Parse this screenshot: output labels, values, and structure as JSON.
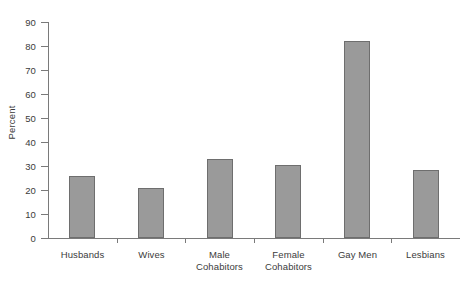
{
  "chart_data": {
    "type": "bar",
    "title": "",
    "xlabel": "",
    "ylabel": "Percent",
    "categories": [
      "Husbands",
      "Wives",
      "Male Cohabitors",
      "Female Cohabitors",
      "Gay Men",
      "Lesbians"
    ],
    "category_lines": [
      [
        "Husbands"
      ],
      [
        "Wives"
      ],
      [
        "Male",
        "Cohabitors"
      ],
      [
        "Female",
        "Cohabitors"
      ],
      [
        "Gay Men"
      ],
      [
        "Lesbians"
      ]
    ],
    "values": [
      26,
      21,
      33,
      30.5,
      82,
      28.5
    ],
    "ylim": [
      0,
      90
    ],
    "yticks": [
      0,
      10,
      20,
      30,
      40,
      50,
      60,
      70,
      80,
      90
    ],
    "ytick_labels": [
      "0",
      "10",
      "20",
      "30",
      "40",
      "50",
      "60",
      "70",
      "80",
      "90"
    ],
    "grid": false,
    "legend": false,
    "legend_position": "none",
    "bar_fill_color": "#9a9a9a",
    "bar_border_color": "#6e6e6e",
    "axis_color": "#7a7a7a",
    "text_color": "#3b3b3b",
    "background_color": "#ffffff"
  }
}
